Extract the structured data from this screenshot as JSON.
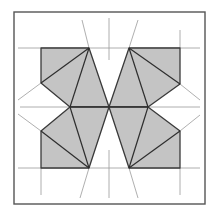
{
  "diagram": {
    "title": "",
    "colors": {
      "fill": "#c4c4c4",
      "stroke": "#3a3a3a",
      "guide": "#9a9a9a",
      "frame": "#555555",
      "background": "#ffffff"
    },
    "frame": {
      "x": 14,
      "y": 12,
      "width": 191,
      "height": 192
    },
    "center": {
      "x": 109,
      "y": 107
    },
    "polygons": [
      {
        "name": "top-left-wing",
        "points": "41,48 89,48 109,107 70,107 41,83"
      },
      {
        "name": "top-right-wing",
        "points": "129,48 180,48 180,84 148,107 109,107"
      },
      {
        "name": "bottom-left-wing",
        "points": "70,107 109,107 89,168 41,168 41,131"
      },
      {
        "name": "bottom-right-wing",
        "points": "109,107 148,107 180,131 180,168 129,168"
      }
    ],
    "labels": []
  }
}
